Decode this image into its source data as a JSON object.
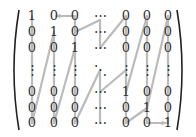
{
  "colors": {
    "text": "#333333",
    "path": "#bbbbbb",
    "bracket": "#222222"
  },
  "columns_x": [
    32,
    54,
    75,
    100,
    126,
    147,
    168
  ],
  "rows_y": [
    16,
    32,
    48,
    70,
    92,
    108,
    123
  ],
  "matrix": [
    [
      "1",
      "0",
      "0",
      "⋯",
      "0",
      "0",
      "0"
    ],
    [
      "0",
      "1",
      "0",
      "⋯",
      "0",
      "0",
      "0"
    ],
    [
      "0",
      "0",
      "1",
      "⋯",
      "0",
      "0",
      "0"
    ],
    [
      "⋮",
      "⋮",
      "⋮",
      "⋱",
      "⋮",
      "⋮",
      "⋮"
    ],
    [
      "0",
      "0",
      "0",
      "⋯",
      "1",
      "0",
      "0"
    ],
    [
      "0",
      "0",
      "0",
      "⋯",
      "0",
      "1",
      "0"
    ],
    [
      "0",
      "0",
      "0",
      "⋯",
      "0",
      "0",
      "1"
    ]
  ],
  "path_segments": [
    [
      [
        75,
        16
      ],
      [
        56,
        16
      ]
    ],
    [
      [
        32,
        16
      ],
      [
        32,
        123
      ]
    ],
    [
      [
        32,
        123
      ],
      [
        54,
        32
      ]
    ],
    [
      [
        54,
        32
      ],
      [
        54,
        123
      ]
    ],
    [
      [
        54,
        123
      ],
      [
        75,
        48
      ]
    ],
    [
      [
        75,
        16
      ],
      [
        75,
        123
      ]
    ],
    [
      [
        75,
        123
      ],
      [
        100,
        70
      ]
    ],
    [
      [
        75,
        32
      ],
      [
        100,
        20
      ]
    ],
    [
      [
        100,
        20
      ],
      [
        100,
        48
      ]
    ],
    [
      [
        100,
        48
      ],
      [
        126,
        16
      ]
    ],
    [
      [
        126,
        16
      ],
      [
        126,
        123
      ]
    ],
    [
      [
        126,
        92
      ],
      [
        147,
        16
      ]
    ],
    [
      [
        147,
        16
      ],
      [
        147,
        123
      ]
    ],
    [
      [
        147,
        108
      ],
      [
        168,
        16
      ]
    ],
    [
      [
        168,
        16
      ],
      [
        168,
        123
      ]
    ],
    [
      [
        100,
        123
      ],
      [
        100,
        70
      ]
    ],
    [
      [
        100,
        92
      ],
      [
        126,
        70
      ]
    ],
    [
      [
        126,
        123
      ],
      [
        147,
        108
      ]
    ],
    [
      [
        147,
        123
      ],
      [
        166,
        123
      ]
    ]
  ],
  "arrows": [
    {
      "from": [
        75,
        16
      ],
      "to": [
        56,
        16
      ]
    },
    {
      "from": [
        150,
        123
      ],
      "to": [
        166,
        123
      ]
    }
  ]
}
